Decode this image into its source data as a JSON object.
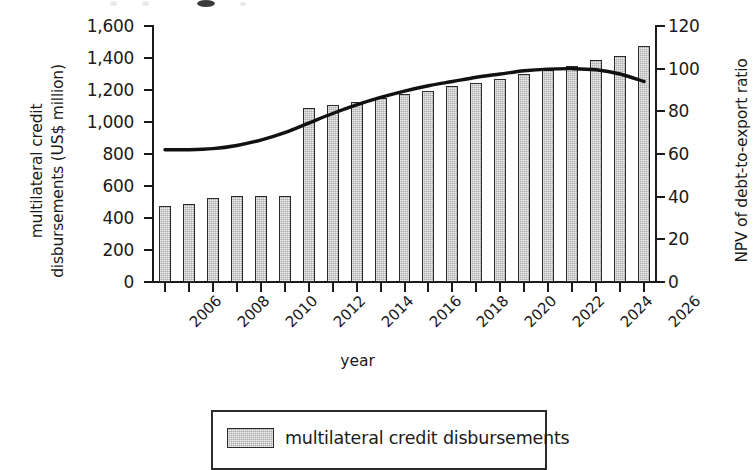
{
  "chart_data": {
    "type": "bar",
    "title": "",
    "xlabel": "year",
    "ylabel": "multilateral credit disbursements (US$ million)",
    "ylabel_line1": "multilateral credit",
    "ylabel_line2": "disbursements (US$ million)",
    "y2label": "NPV of debt-to-export ratio",
    "ylim": [
      0,
      1600
    ],
    "y2lim": [
      0,
      120
    ],
    "yticks": [
      "0",
      "200",
      "400",
      "600",
      "800",
      "1,000",
      "1,200",
      "1,400",
      "1,600"
    ],
    "ytick_values": [
      0,
      200,
      400,
      600,
      800,
      1000,
      1200,
      1400,
      1600
    ],
    "y2ticks": [
      "0",
      "20",
      "40",
      "60",
      "80",
      "100",
      "120"
    ],
    "y2tick_values": [
      0,
      20,
      40,
      60,
      80,
      100,
      120
    ],
    "grid": false,
    "legend_position": "bottom",
    "categories": [
      "2006",
      "2007",
      "2008",
      "2009",
      "2010",
      "2011",
      "2012",
      "2013",
      "2014",
      "2015",
      "2016",
      "2017",
      "2018",
      "2019",
      "2020",
      "2021",
      "2022",
      "2023",
      "2024",
      "2025",
      "2026"
    ],
    "xtick_labels": [
      "2006",
      "2008",
      "2010",
      "2012",
      "2014",
      "2016",
      "2018",
      "2020",
      "2022",
      "2024",
      "2026"
    ],
    "series": [
      {
        "name": "multilateral credit disbursements",
        "type": "bar",
        "axis": "left",
        "unit": "US$ million",
        "values": [
          475,
          487,
          525,
          537,
          540,
          540,
          1085,
          1108,
          1128,
          1148,
          1172,
          1192,
          1222,
          1245,
          1270,
          1297,
          1325,
          1352,
          1385,
          1412,
          1472
        ]
      },
      {
        "name": "NPV of debt-to-export ratio",
        "type": "line",
        "axis": "right",
        "unit": "ratio",
        "values": [
          62,
          62,
          62.5,
          64,
          66.5,
          70,
          74.5,
          79,
          83,
          86.5,
          89.5,
          92,
          94,
          96,
          97.5,
          99,
          99.8,
          100,
          99.5,
          97.5,
          94
        ]
      }
    ],
    "colors": {
      "bar_fill": "#a8a8a8",
      "bar_border": "#2b2b2b",
      "line": "#111111",
      "axis": "#1a1a1a",
      "background": "#ffffff"
    }
  },
  "legend": {
    "items": [
      {
        "label": "multilateral credit disbursements",
        "marker": "bar-swatch"
      }
    ]
  }
}
